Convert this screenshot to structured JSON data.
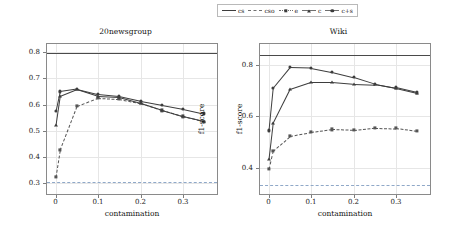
{
  "legend": {
    "position": "top-center",
    "entries": [
      {
        "label": "cs",
        "key": "line-solid",
        "icon": "solid-line-icon"
      },
      {
        "label": "cso",
        "key": "line-dashed",
        "icon": "dashed-line-icon"
      },
      {
        "label": "e",
        "key": "marker-square-dashed",
        "icon": "square-marker-icon"
      },
      {
        "label": "c",
        "key": "marker-triangle-solid",
        "icon": "triangle-marker-icon"
      },
      {
        "label": "c+s",
        "key": "marker-circle-solid",
        "icon": "circle-marker-icon"
      }
    ]
  },
  "chart_data": [
    {
      "type": "line",
      "title": "20newsgroup",
      "xlabel": "contamination",
      "ylabel": "f1-score",
      "ylabel_side": "right",
      "xlim": [
        -0.02,
        0.38
      ],
      "ylim": [
        0.26,
        0.83
      ],
      "xticks": [
        0,
        0.1,
        0.2,
        0.3
      ],
      "xticklabels": [
        "0",
        "0.1",
        "0.2",
        "0.3"
      ],
      "yticks": [
        0.3,
        0.4,
        0.5,
        0.6,
        0.7,
        0.8
      ],
      "yticklabels": [
        "0.3",
        "0.4",
        "0.5",
        "0.6",
        "0.7",
        "0.8"
      ],
      "grid": true,
      "hlines": [
        {
          "name": "cs",
          "value": 0.795,
          "style": "solid",
          "color": "#4a4a4a"
        },
        {
          "name": "cso",
          "value": 0.307,
          "style": "dashed",
          "color": "#8fa8c8"
        }
      ],
      "x": [
        0,
        0.01,
        0.05,
        0.1,
        0.15,
        0.2,
        0.25,
        0.3,
        0.35
      ],
      "series": [
        {
          "name": "e",
          "marker": "square",
          "style": "dashed",
          "color": "#555555",
          "values": [
            0.325,
            0.427,
            0.594,
            0.625,
            0.621,
            0.605,
            0.578,
            0.555,
            0.535
          ]
        },
        {
          "name": "c",
          "marker": "triangle",
          "style": "solid",
          "color": "#3d3d3d",
          "values": [
            0.521,
            0.632,
            0.658,
            0.632,
            0.628,
            0.606,
            0.58,
            0.556,
            0.537
          ]
        },
        {
          "name": "c+s",
          "marker": "circle",
          "style": "solid",
          "color": "#3d3d3d",
          "values": [
            0.576,
            0.65,
            0.66,
            0.64,
            0.632,
            0.614,
            0.599,
            0.584,
            0.566
          ]
        }
      ]
    },
    {
      "type": "line",
      "title": "Wiki",
      "xlabel": "contamination",
      "ylabel": "f1-score",
      "ylabel_side": "left",
      "xlim": [
        -0.02,
        0.38
      ],
      "ylim": [
        0.3,
        0.88
      ],
      "xticks": [
        0,
        0.1,
        0.2,
        0.3
      ],
      "xticklabels": [
        "0",
        "0.1",
        "0.2",
        "0.3"
      ],
      "yticks": [
        0.4,
        0.6,
        0.8
      ],
      "yticklabels": [
        "0.4",
        "0.6",
        "0.8"
      ],
      "grid": true,
      "hlines": [
        {
          "name": "cs",
          "value": 0.838,
          "style": "solid",
          "color": "#4a4a4a"
        },
        {
          "name": "cso",
          "value": 0.333,
          "style": "dashed",
          "color": "#8fa8c8"
        }
      ],
      "x": [
        0,
        0.01,
        0.05,
        0.1,
        0.15,
        0.2,
        0.25,
        0.3,
        0.35
      ],
      "series": [
        {
          "name": "e",
          "marker": "square",
          "style": "dashed",
          "color": "#555555",
          "values": [
            0.397,
            0.468,
            0.524,
            0.539,
            0.55,
            0.547,
            0.556,
            0.554,
            0.543
          ]
        },
        {
          "name": "c",
          "marker": "triangle",
          "style": "solid",
          "color": "#3d3d3d",
          "values": [
            0.434,
            0.575,
            0.706,
            0.734,
            0.734,
            0.727,
            0.724,
            0.709,
            0.69
          ]
        },
        {
          "name": "c+s",
          "marker": "circle",
          "style": "solid",
          "color": "#3d3d3d",
          "values": [
            0.546,
            0.711,
            0.791,
            0.789,
            0.773,
            0.753,
            0.727,
            0.712,
            0.693
          ]
        }
      ]
    }
  ]
}
